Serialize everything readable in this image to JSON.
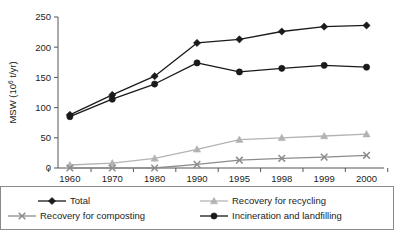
{
  "chart_data": {
    "type": "line",
    "title": "",
    "xlabel": "",
    "ylabel": "MSW (10⁶ t/yr)",
    "ylabel_base": "MSW (10",
    "ylabel_exp": "6",
    "ylabel_tail": " t/yr)",
    "categories": [
      "1960",
      "1970",
      "1980",
      "1990",
      "1995",
      "1998",
      "1999",
      "2000"
    ],
    "ylim": [
      0,
      250
    ],
    "yticks": [
      0,
      50,
      100,
      150,
      200,
      250
    ],
    "ytick_labels": [
      "0",
      "50",
      "100",
      "150",
      "200",
      "250"
    ],
    "grid": false,
    "legend_position": "bottom",
    "series": [
      {
        "name": "Total",
        "marker": "diamond",
        "color": "#1a1a1a",
        "values": [
          88,
          121,
          152,
          207,
          213,
          226,
          234,
          236
        ]
      },
      {
        "name": "Recovery for recycling",
        "marker": "triangle",
        "color": "#b3b3b3",
        "values": [
          5,
          8,
          16,
          31,
          47,
          50,
          53,
          56
        ]
      },
      {
        "name": "Recovery for composting",
        "marker": "x",
        "color": "#8c8c8c",
        "values": [
          0,
          0,
          0,
          6,
          13,
          16,
          18,
          21
        ]
      },
      {
        "name": "Incineration and landfilling",
        "marker": "circle",
        "color": "#1a1a1a",
        "values": [
          85,
          114,
          139,
          174,
          159,
          165,
          170,
          167
        ]
      }
    ]
  },
  "legend": {
    "entries": [
      {
        "label": "Total",
        "marker": "diamond",
        "color": "#1a1a1a"
      },
      {
        "label": "Recovery for recycling",
        "marker": "triangle",
        "color": "#b3b3b3"
      },
      {
        "label": "Recovery for composting",
        "marker": "x",
        "color": "#8c8c8c"
      },
      {
        "label": "Incineration and landfilling",
        "marker": "circle",
        "color": "#1a1a1a"
      }
    ]
  }
}
